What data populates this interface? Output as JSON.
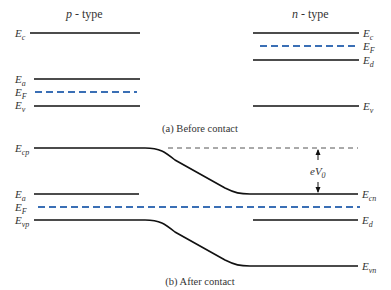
{
  "titles": {
    "p_type": "p",
    "p_suffix": " - type",
    "n_type": "n",
    "n_suffix": " - type"
  },
  "captions": {
    "before": "(a) Before contact",
    "after": "(b) After contact"
  },
  "before_contact": {
    "p_side": {
      "levels": [
        {
          "symbol": "E",
          "sub": "c",
          "kind": "solid"
        },
        {
          "symbol": "E",
          "sub": "a",
          "kind": "solid"
        },
        {
          "symbol": "E",
          "sub": "F",
          "kind": "dashed"
        },
        {
          "symbol": "E",
          "sub": "v",
          "kind": "solid"
        }
      ]
    },
    "n_side": {
      "levels": [
        {
          "symbol": "E",
          "sub": "c",
          "kind": "solid"
        },
        {
          "symbol": "E",
          "sub": "F",
          "kind": "dashed"
        },
        {
          "symbol": "E",
          "sub": "d",
          "kind": "solid"
        },
        {
          "symbol": "E",
          "sub": "v",
          "kind": "solid"
        }
      ]
    }
  },
  "after_contact": {
    "left_labels": [
      {
        "symbol": "E",
        "sub": "cp"
      },
      {
        "symbol": "E",
        "sub": "a"
      },
      {
        "symbol": "E",
        "sub": "F"
      },
      {
        "symbol": "E",
        "sub": "vp"
      }
    ],
    "right_labels": [
      {
        "symbol": "E",
        "sub": "cn"
      },
      {
        "symbol": "E",
        "sub": "d"
      },
      {
        "symbol": "E",
        "sub": "vn"
      }
    ],
    "barrier": {
      "symbol": "eV",
      "sub": "0"
    }
  },
  "colors": {
    "line": "#111111",
    "fermi": "#3a6fb5",
    "ref_dash": "#555555",
    "text": "#333333"
  }
}
